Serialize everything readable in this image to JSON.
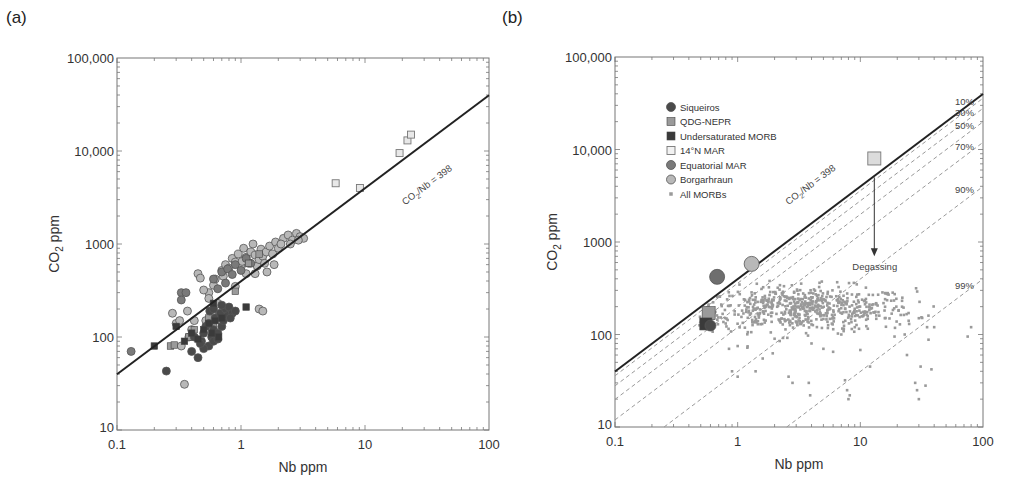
{
  "panels": {
    "a": {
      "label": "(a)"
    },
    "b": {
      "label": "(b)"
    }
  },
  "chart_data": [
    {
      "type": "scatter",
      "panel": "(a)",
      "title": "",
      "xlabel": "Nb ppm",
      "ylabel": "CO2 ppm",
      "xscale": "log",
      "yscale": "log",
      "xlim": [
        0.1,
        100
      ],
      "ylim": [
        10,
        100000
      ],
      "xticks": [
        "0.1",
        "1",
        "10",
        "100"
      ],
      "yticks": [
        "10",
        "100",
        "1000",
        "10,000",
        "100,000"
      ],
      "reference_line": {
        "label": "CO2/Nb = 398",
        "slope_ratio": 398
      },
      "series": [
        {
          "name": "14°N MAR",
          "marker": "open-square",
          "color": "#e8e8e8",
          "points": [
            [
              5.8,
              4500
            ],
            [
              9.1,
              4000
            ],
            [
              19,
              9500
            ],
            [
              22,
              13000
            ],
            [
              23.5,
              15000
            ]
          ]
        },
        {
          "name": "Borgarhraun",
          "marker": "circle",
          "color": "#b8b8b8",
          "points": [
            [
              0.35,
              31
            ],
            [
              0.3,
              140
            ],
            [
              0.28,
              180
            ],
            [
              0.32,
              150
            ],
            [
              0.37,
              190
            ],
            [
              0.45,
              480
            ],
            [
              0.47,
              430
            ],
            [
              0.55,
              300
            ],
            [
              0.6,
              360
            ],
            [
              0.62,
              420
            ],
            [
              0.7,
              520
            ],
            [
              0.75,
              600
            ],
            [
              0.8,
              550
            ],
            [
              0.85,
              700
            ],
            [
              0.9,
              640
            ],
            [
              0.95,
              780
            ],
            [
              1.0,
              560
            ],
            [
              1.05,
              900
            ],
            [
              1.1,
              720
            ],
            [
              1.15,
              620
            ],
            [
              1.2,
              820
            ],
            [
              1.25,
              1000
            ],
            [
              1.3,
              760
            ],
            [
              1.35,
              580
            ],
            [
              1.4,
              680
            ],
            [
              1.45,
              880
            ],
            [
              1.5,
              740
            ],
            [
              1.55,
              620
            ],
            [
              1.6,
              820
            ],
            [
              1.7,
              950
            ],
            [
              1.8,
              780
            ],
            [
              1.9,
              1050
            ],
            [
              2.0,
              900
            ],
            [
              2.2,
              1150
            ],
            [
              2.4,
              1250
            ],
            [
              2.6,
              1100
            ],
            [
              2.8,
              1300
            ],
            [
              3.0,
              1200
            ],
            [
              3.2,
              1150
            ],
            [
              1.4,
              200
            ],
            [
              1.5,
              190
            ],
            [
              0.9,
              350
            ],
            [
              1.1,
              480
            ],
            [
              1.3,
              480
            ],
            [
              0.55,
              260
            ],
            [
              0.65,
              230
            ],
            [
              0.58,
              180
            ],
            [
              0.52,
              150
            ],
            [
              0.42,
              150
            ],
            [
              0.4,
              120
            ],
            [
              0.38,
              100
            ],
            [
              0.33,
              80
            ],
            [
              0.5,
              320
            ],
            [
              0.72,
              450
            ],
            [
              1.02,
              650
            ],
            [
              1.62,
              500
            ],
            [
              1.85,
              600
            ],
            [
              2.1,
              1000
            ],
            [
              2.5,
              1000
            ],
            [
              2.9,
              1100
            ]
          ]
        },
        {
          "name": "Equatorial MAR",
          "marker": "circle",
          "color": "#7a7a7a",
          "points": [
            [
              0.13,
              70
            ],
            [
              0.33,
              300
            ],
            [
              0.36,
              300
            ],
            [
              0.33,
              250
            ],
            [
              0.6,
              420
            ],
            [
              0.7,
              500
            ],
            [
              0.78,
              540
            ],
            [
              0.85,
              470
            ],
            [
              0.9,
              600
            ],
            [
              1.0,
              520
            ],
            [
              0.75,
              380
            ],
            [
              0.65,
              330
            ],
            [
              1.2,
              620
            ],
            [
              1.1,
              700
            ]
          ]
        },
        {
          "name": "Siqueiros",
          "marker": "circle",
          "color": "#4a4a4a",
          "points": [
            [
              0.25,
              43
            ],
            [
              0.4,
              70
            ],
            [
              0.45,
              60
            ],
            [
              0.42,
              100
            ],
            [
              0.48,
              90
            ],
            [
              0.5,
              110
            ],
            [
              0.52,
              130
            ],
            [
              0.55,
              140
            ],
            [
              0.58,
              100
            ],
            [
              0.6,
              120
            ],
            [
              0.62,
              160
            ],
            [
              0.65,
              110
            ],
            [
              0.68,
              180
            ],
            [
              0.7,
              130
            ],
            [
              0.72,
              150
            ],
            [
              0.75,
              200
            ],
            [
              0.78,
              170
            ],
            [
              0.8,
              210
            ],
            [
              0.85,
              180
            ],
            [
              0.55,
              80
            ],
            [
              0.6,
              90
            ],
            [
              0.65,
              95
            ],
            [
              0.5,
              75
            ],
            [
              0.47,
              85
            ],
            [
              0.56,
              190
            ],
            [
              0.6,
              200
            ],
            [
              0.7,
              220
            ],
            [
              0.82,
              160
            ],
            [
              0.9,
              190
            ]
          ]
        },
        {
          "name": "Undersaturated MORB",
          "marker": "square",
          "color": "#3a3a3a",
          "points": [
            [
              0.2,
              80
            ],
            [
              0.3,
              130
            ],
            [
              0.35,
              90
            ],
            [
              0.4,
              110
            ],
            [
              0.45,
              95
            ],
            [
              0.5,
              120
            ],
            [
              0.55,
              140
            ],
            [
              0.6,
              230
            ],
            [
              0.62,
              150
            ],
            [
              0.7,
              160
            ],
            [
              1.1,
              210
            ],
            [
              0.66,
              100
            ],
            [
              0.58,
              110
            ]
          ]
        },
        {
          "name": "QDG-NEPR",
          "marker": "square",
          "color": "#9a9a9a",
          "points": [
            [
              0.27,
              80
            ],
            [
              0.29,
              82
            ],
            [
              0.38,
              100
            ],
            [
              0.42,
              120
            ],
            [
              0.55,
              160
            ],
            [
              0.6,
              130
            ],
            [
              0.72,
              180
            ],
            [
              0.9,
              310
            ],
            [
              1.15,
              620
            ],
            [
              1.4,
              780
            ]
          ]
        }
      ]
    },
    {
      "type": "scatter",
      "panel": "(b)",
      "title": "",
      "xlabel": "Nb ppm",
      "ylabel": "CO2 ppm",
      "xscale": "log",
      "yscale": "log",
      "xlim": [
        0.1,
        100
      ],
      "ylim": [
        10,
        100000
      ],
      "xticks": [
        "0.1",
        "1",
        "10",
        "100"
      ],
      "yticks": [
        "10",
        "100",
        "1000",
        "10,000",
        "100,000"
      ],
      "reference_line": {
        "label": "CO2/Nb = 398",
        "slope_ratio": 398
      },
      "degassing_lines": [
        {
          "label": "10%",
          "ratio": 358.2
        },
        {
          "label": "30%",
          "ratio": 278.6
        },
        {
          "label": "50%",
          "ratio": 199
        },
        {
          "label": "70%",
          "ratio": 119.4
        },
        {
          "label": "90%",
          "ratio": 39.8
        },
        {
          "label": "99%",
          "ratio": 3.98
        }
      ],
      "annotation": {
        "label": "Degassing",
        "arrow_from": [
          13,
          5000
        ],
        "arrow_to": [
          13,
          700
        ]
      },
      "legend": {
        "position": "upper-left",
        "entries": [
          {
            "label": "Siqueiros",
            "marker": "circle",
            "color": "#4a4a4a"
          },
          {
            "label": "QDG-NEPR",
            "marker": "square",
            "color": "#9a9a9a"
          },
          {
            "label": "Undersaturated MORB",
            "marker": "square",
            "color": "#3a3a3a"
          },
          {
            "label": "14°N MAR",
            "marker": "open-square",
            "color": "#e8e8e8"
          },
          {
            "label": "Equatorial MAR",
            "marker": "circle",
            "color": "#7a7a7a"
          },
          {
            "label": "Borgarhraun",
            "marker": "circle",
            "color": "#b8b8b8"
          },
          {
            "label": "All MORBs",
            "marker": "small-square",
            "color": "#9a9a9a"
          }
        ]
      },
      "series": [
        {
          "name": "14°N MAR",
          "marker": "open-square",
          "color": "#dcdcdc",
          "size": 13,
          "points": [
            [
              13,
              8000
            ]
          ]
        },
        {
          "name": "Borgarhraun",
          "marker": "circle",
          "color": "#b8b8b8",
          "size": 15,
          "points": [
            [
              1.3,
              580
            ]
          ]
        },
        {
          "name": "Equatorial MAR",
          "marker": "circle",
          "color": "#6e6e6e",
          "size": 15,
          "points": [
            [
              0.68,
              420
            ]
          ]
        },
        {
          "name": "QDG-NEPR",
          "marker": "square",
          "color": "#9a9a9a",
          "size": 13,
          "points": [
            [
              0.58,
              170
            ]
          ]
        },
        {
          "name": "Undersaturated MORB",
          "marker": "square",
          "color": "#3a3a3a",
          "size": 12,
          "points": [
            [
              0.55,
              130
            ]
          ]
        },
        {
          "name": "Siqueiros",
          "marker": "circle",
          "color": "#4a4a4a",
          "size": 11,
          "points": [
            [
              0.6,
              125
            ]
          ]
        },
        {
          "name": "All MORBs",
          "marker": "small-square",
          "color": "#9a9a9a",
          "cloud": {
            "count": 650,
            "center_x": 3.5,
            "center_y": 190,
            "spread_x_dec": 0.45,
            "spread_y_dec": 0.12
          },
          "outliers": [
            [
              0.85,
              70
            ],
            [
              1.0,
              75
            ],
            [
              1.2,
              72
            ],
            [
              0.9,
              40
            ],
            [
              1.0,
              35
            ],
            [
              1.4,
              40
            ],
            [
              1.6,
              55
            ],
            [
              2.6,
              35
            ],
            [
              2.8,
              30
            ],
            [
              3.8,
              30
            ],
            [
              3.9,
              22
            ],
            [
              7.5,
              32
            ],
            [
              7.8,
              25
            ],
            [
              8.0,
              20
            ],
            [
              8.2,
              22
            ],
            [
              10,
              68
            ],
            [
              12,
              45
            ],
            [
              17,
              270
            ],
            [
              22,
              250
            ],
            [
              23,
              100
            ],
            [
              24,
              60
            ],
            [
              28,
              30
            ],
            [
              29,
              25
            ],
            [
              30,
              20
            ],
            [
              31,
              45
            ],
            [
              34,
              28
            ],
            [
              38,
              42
            ],
            [
              40,
              120
            ],
            [
              75,
              95
            ],
            [
              80,
              120
            ],
            [
              19,
              95
            ],
            [
              25,
              130
            ],
            [
              30,
              150
            ],
            [
              35,
              120
            ],
            [
              2.0,
              90
            ],
            [
              2.2,
              85
            ],
            [
              4,
              80
            ],
            [
              5,
              70
            ],
            [
              6,
              65
            ],
            [
              7,
              100
            ]
          ]
        }
      ]
    }
  ]
}
